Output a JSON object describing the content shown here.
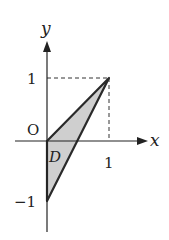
{
  "diagram": {
    "axes": {
      "x_label": "x",
      "y_label": "y",
      "origin_label": "O"
    },
    "ticks": {
      "x_one": "1",
      "y_one": "1",
      "y_minus_one": "−1"
    },
    "region": {
      "label": "D",
      "vertices": [
        [
          0,
          0
        ],
        [
          1,
          1
        ],
        [
          0,
          -1
        ]
      ],
      "fill": "#cfcfcf"
    },
    "guides": {
      "dashed_to_point": [
        1,
        1
      ]
    }
  }
}
